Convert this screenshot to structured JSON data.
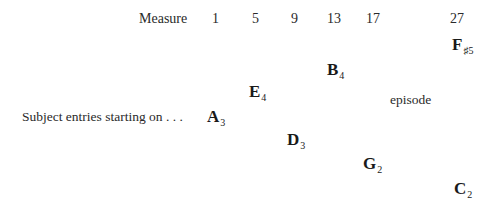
{
  "header": {
    "label": "Measure",
    "measures": [
      "1",
      "5",
      "9",
      "13",
      "17",
      "27"
    ]
  },
  "row_label": "Subject entries starting on . . .",
  "episode_label": "episode",
  "entries": [
    {
      "measure": "1",
      "note": "A",
      "octave": "3"
    },
    {
      "measure": "5",
      "note": "E",
      "octave": "4"
    },
    {
      "measure": "9",
      "note": "D",
      "octave": "3"
    },
    {
      "measure": "13",
      "note": "B",
      "octave": "4"
    },
    {
      "measure": "17",
      "note": "G",
      "octave": "2"
    },
    {
      "measure": "27",
      "note": "F",
      "octave": "♯5"
    },
    {
      "measure": "27",
      "note": "C",
      "octave": "2"
    }
  ]
}
